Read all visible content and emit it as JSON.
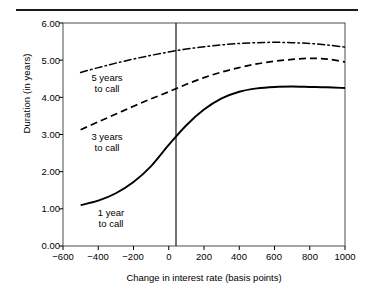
{
  "figure": {
    "top_rule": true,
    "background": "#ffffff",
    "ink_color": "#000000"
  },
  "chart_data": {
    "type": "line",
    "title": "",
    "xlabel": "Change in interest rate (basis points)",
    "ylabel": "Duration (in years)",
    "xlim": [
      -600,
      1000
    ],
    "ylim": [
      0.0,
      6.0
    ],
    "xticks": [
      -600,
      -400,
      -200,
      0,
      200,
      400,
      600,
      800,
      1000
    ],
    "xtick_labels": [
      "−600",
      "−400",
      "−200",
      "0",
      "200",
      "400",
      "600",
      "800",
      "1000"
    ],
    "yticks": [
      0.0,
      1.0,
      2.0,
      3.0,
      4.0,
      5.0,
      6.0
    ],
    "ytick_labels": [
      "0.00",
      "1.00",
      "2.00",
      "3.00",
      "4.00",
      "5.00",
      "6.00"
    ],
    "grid": false,
    "legend": "inline-annotations",
    "annotations": [
      {
        "name": "five-years-to-call-label",
        "text_line1": "5 years",
        "text_line2": "to call",
        "x": -290,
        "y": 4.62
      },
      {
        "name": "three-years-to-call-label",
        "text_line1": "3 years",
        "text_line2": "to call",
        "x": -290,
        "y": 3.02
      },
      {
        "name": "one-year-to-call-label",
        "text_line1": "1 year",
        "text_line2": "to call",
        "x": -270,
        "y": 0.95
      }
    ],
    "reference_lines": [
      {
        "name": "zero-basis-points-line",
        "axis": "x",
        "value": 0,
        "style": "solid"
      }
    ],
    "x": [
      -500,
      -400,
      -300,
      -200,
      -100,
      0,
      100,
      200,
      300,
      400,
      500,
      600,
      700,
      800,
      900,
      1000
    ],
    "series": [
      {
        "name": "5 years to call",
        "style": "dash-dot",
        "values": [
          4.67,
          4.8,
          4.92,
          5.03,
          5.13,
          5.22,
          5.3,
          5.36,
          5.41,
          5.45,
          5.47,
          5.48,
          5.47,
          5.45,
          5.41,
          5.35
        ]
      },
      {
        "name": "3 years to call",
        "style": "dashed",
        "values": [
          3.13,
          3.34,
          3.55,
          3.76,
          3.96,
          4.15,
          4.35,
          4.53,
          4.68,
          4.8,
          4.9,
          4.97,
          5.02,
          5.05,
          5.03,
          4.95
        ]
      },
      {
        "name": "1 year to call",
        "style": "solid",
        "values": [
          1.1,
          1.22,
          1.42,
          1.72,
          2.15,
          2.72,
          3.25,
          3.67,
          3.97,
          4.15,
          4.24,
          4.28,
          4.29,
          4.28,
          4.27,
          4.25
        ]
      }
    ]
  }
}
